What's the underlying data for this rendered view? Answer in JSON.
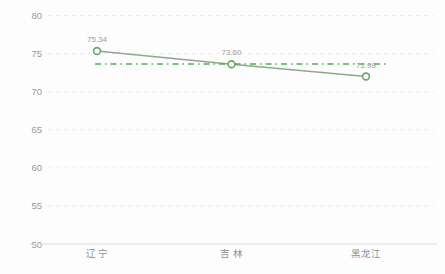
{
  "chart_data": {
    "type": "line",
    "title": "",
    "xlabel": "",
    "ylabel": "",
    "categories": [
      "辽 宁",
      "吉 林",
      "黑龙江"
    ],
    "series": [
      {
        "name": "series-1",
        "values": [
          75.34,
          73.6,
          71.99
        ],
        "data_labels": [
          "75.34",
          "73.60",
          "71.99"
        ]
      }
    ],
    "average_line": {
      "value": 73.64,
      "style": "dash-dot"
    },
    "ylim": [
      50,
      80
    ],
    "ytick_interval": 5,
    "yticks": [
      "50",
      "55",
      "60",
      "65",
      "70",
      "75",
      "80"
    ],
    "grid": "faint-dashed-horizontal",
    "legend": "none",
    "colors": {
      "background": "#fdfdfd",
      "series_line": "#90a78e",
      "marker_stroke": "#6aa56a",
      "marker_fill": "#ffffff",
      "average_line": "#4cae50",
      "axis_line": "#dcdcdc",
      "gridline": "#efefef",
      "tick_label": "#9a9a9a",
      "data_label": "#9b9b9b",
      "category_label": "#8f8f8f"
    }
  }
}
